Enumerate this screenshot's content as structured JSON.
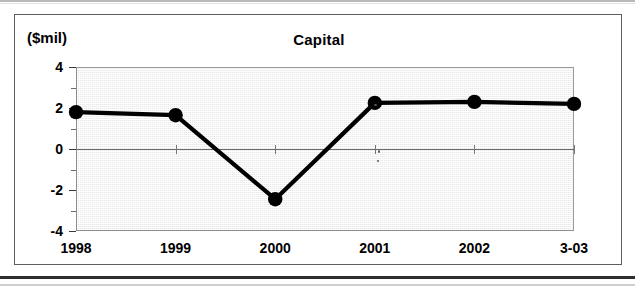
{
  "figure": {
    "title": "Capital",
    "unit_label": "($mil)"
  },
  "chart_data": {
    "type": "line",
    "title": "Capital",
    "xlabel": "",
    "ylabel": "($mil)",
    "categories": [
      "1998",
      "1999",
      "2000",
      "2001",
      "2002",
      "3-03"
    ],
    "values": [
      1.8,
      1.65,
      -2.45,
      2.25,
      2.3,
      2.2
    ],
    "series": [
      {
        "name": "Capital",
        "values": [
          1.8,
          1.65,
          -2.45,
          2.25,
          2.3,
          2.2
        ]
      }
    ],
    "ylim": [
      -4,
      4
    ],
    "ytick_labels": [
      "4",
      "2",
      "0",
      "-2",
      "-4"
    ],
    "ytick_values": [
      4,
      2,
      0,
      -2,
      -4
    ],
    "yminor_step": 1,
    "grid": false,
    "zero_line": true,
    "legend": null,
    "marker": "filled-circle",
    "line_color": "#000000",
    "marker_color": "#000000",
    "plot_background": "#e8e8e8"
  }
}
